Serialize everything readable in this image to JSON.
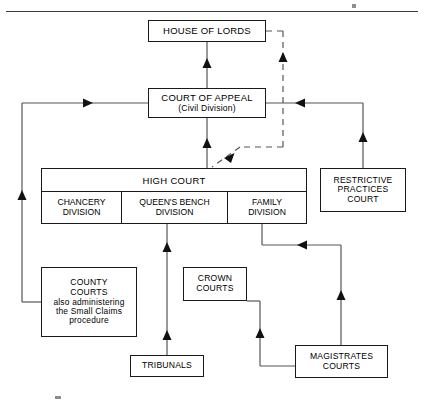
{
  "diagram": {
    "type": "flowchart",
    "title_rule": true,
    "nodes": [
      {
        "id": "house-of-lords",
        "name": "house-of-lords-box",
        "lines": [
          "HOUSE OF LORDS"
        ],
        "styles": [
          "main"
        ],
        "x": 148,
        "y": 20,
        "w": 118,
        "h": 22
      },
      {
        "id": "court-of-appeal",
        "name": "court-of-appeal-box",
        "lines": [
          "COURT OF APPEAL",
          "(Civil Division)"
        ],
        "styles": [
          "main",
          "sub"
        ],
        "x": 148,
        "y": 88,
        "w": 118,
        "h": 30
      },
      {
        "id": "restrictive-practices-court",
        "name": "restrictive-practices-court-box",
        "lines": [
          "RESTRICTIVE",
          "PRACTICES",
          "COURT"
        ],
        "styles": [
          "sub",
          "sub",
          "sub"
        ],
        "x": 320,
        "y": 168,
        "w": 86,
        "h": 44
      },
      {
        "id": "county-courts",
        "name": "county-courts-box",
        "lines": [
          "COUNTY",
          "COURTS",
          "also administering",
          "the Small Claims",
          "procedure"
        ],
        "styles": [
          "sub",
          "sub",
          "small",
          "small",
          "small"
        ],
        "x": 41,
        "y": 267,
        "w": 96,
        "h": 70
      },
      {
        "id": "crown-courts",
        "name": "crown-courts-box",
        "lines": [
          "CROWN",
          "COURTS"
        ],
        "styles": [
          "sub",
          "sub"
        ],
        "x": 183,
        "y": 267,
        "w": 64,
        "h": 34
      },
      {
        "id": "tribunals",
        "name": "tribunals-box",
        "lines": [
          "TRIBUNALS"
        ],
        "styles": [
          "sub"
        ],
        "x": 130,
        "y": 355,
        "w": 74,
        "h": 22
      },
      {
        "id": "magistrates-courts",
        "name": "magistrates-courts-box",
        "lines": [
          "MAGISTRATES",
          "COURTS"
        ],
        "styles": [
          "sub",
          "sub"
        ],
        "x": 295,
        "y": 345,
        "w": 93,
        "h": 33
      }
    ],
    "high_court": {
      "title": "HIGH COURT",
      "divisions": [
        {
          "id": "chancery",
          "lines": [
            "CHANCERY",
            "DIVISION"
          ]
        },
        {
          "id": "queens-bench",
          "lines": [
            "QUEEN'S BENCH",
            "DIVISION"
          ]
        },
        {
          "id": "family",
          "lines": [
            "FAMILY",
            "DIVISION"
          ]
        }
      ]
    },
    "edges": [
      {
        "name": "edge-court-of-appeal-to-house-of-lords",
        "style": "solid"
      },
      {
        "name": "edge-high-court-to-court-of-appeal",
        "style": "solid"
      },
      {
        "name": "edge-high-court-to-house-of-lords-leapfrog",
        "style": "dashed"
      },
      {
        "name": "edge-restrictive-practices-court-to-court-of-appeal",
        "style": "solid"
      },
      {
        "name": "edge-county-courts-to-court-of-appeal",
        "style": "solid"
      },
      {
        "name": "edge-tribunals-to-queens-bench-division",
        "style": "solid"
      },
      {
        "name": "edge-magistrates-courts-to-family-division",
        "style": "solid"
      },
      {
        "name": "edge-magistrates-courts-to-crown-courts",
        "style": "solid"
      },
      {
        "name": "edge-crown-courts-to-queens-bench-division",
        "style": "solid"
      }
    ],
    "colors": {
      "line": "#1a1a1a",
      "background": "#ffffff",
      "rule": "#3c3c3c"
    }
  }
}
